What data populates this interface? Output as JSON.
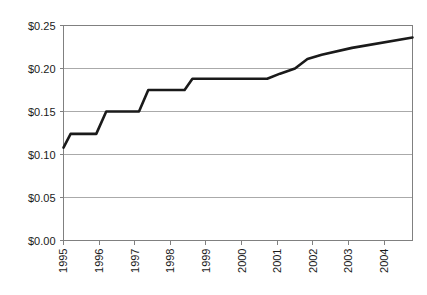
{
  "chart_data": {
    "type": "line",
    "title": "",
    "subtitle": "",
    "xlabel": "",
    "ylabel": "",
    "xlim": [
      1995,
      2004.8
    ],
    "ylim": [
      0.0,
      0.25
    ],
    "grid": true,
    "grid_axis": "y",
    "legend": false,
    "legend_position": "none",
    "x_tick_labels": [
      "1995",
      "1996",
      "1997",
      "1998",
      "1999",
      "2000",
      "2001",
      "2002",
      "2003",
      "2004"
    ],
    "x_tick_values": [
      1995,
      1996,
      1997,
      1998,
      1999,
      2000,
      2001,
      2002,
      2003,
      2004
    ],
    "x_tick_label_rotation": -90,
    "y_tick_labels": [
      "$0.00",
      "$0.05",
      "$0.10",
      "$0.15",
      "$0.20",
      "$0.25"
    ],
    "y_tick_values": [
      0.0,
      0.05,
      0.1,
      0.15,
      0.2,
      0.25
    ],
    "series": [
      {
        "name": "Price",
        "color": "#1a1a1a",
        "line_width": 2.6,
        "x": [
          1995.0,
          1995.2,
          1995.92,
          1996.2,
          1997.12,
          1997.38,
          1998.4,
          1998.62,
          2000.72,
          2001.08,
          2001.5,
          2001.85,
          2002.25,
          2003.1,
          2004.8
        ],
        "y": [
          0.108,
          0.124,
          0.124,
          0.15,
          0.15,
          0.175,
          0.175,
          0.188,
          0.188,
          0.194,
          0.2,
          0.211,
          0.216,
          0.224,
          0.236
        ]
      }
    ],
    "plateaus": [
      {
        "value": 0.124,
        "from": 1995.2,
        "to": 1995.92
      },
      {
        "value": 0.15,
        "from": 1996.2,
        "to": 1997.12
      },
      {
        "value": 0.175,
        "from": 1997.38,
        "to": 1998.4
      },
      {
        "value": 0.188,
        "from": 1998.62,
        "to": 2000.72
      }
    ],
    "start_value": 0.108,
    "end_value": 0.236
  },
  "style": {
    "axis_color": "#808080",
    "grid_color": "#aaaaaa",
    "line_color": "#1a1a1a",
    "text_color": "#1a1a1a",
    "background": "#ffffff"
  }
}
